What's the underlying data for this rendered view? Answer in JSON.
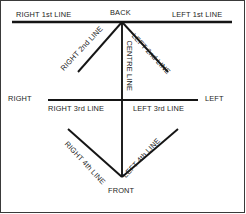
{
  "diagram": {
    "stroke_color": "#151515",
    "text_color": "#1c1c1c",
    "background_color": "#ffffff",
    "border_color": "#3a3a3a",
    "orientation_labels": {
      "back": "BACK",
      "front": "FRONT",
      "right": "RIGHT",
      "left": "LEFT"
    },
    "line_labels": {
      "right_1st": "RIGHT 1st LINE",
      "left_1st": "LEFT 1st LINE",
      "right_2nd": "RIGHT 2nd LINE",
      "left_2nd": "LEFT 2nd LINE",
      "centre": "CENTRE LINE",
      "right_3rd": "RIGHT 3rd LINE",
      "left_3rd": "LEFT 3rd LINE",
      "right_4th": "RIGHT 4th LINE",
      "left_4th": "LEFT 4th LINE"
    },
    "geometry": {
      "back_apex": [
        122,
        22
      ],
      "front_apex": [
        122,
        177
      ],
      "centre_intersection": [
        122,
        100
      ],
      "top_line": [
        12,
        22,
        232,
        22
      ],
      "middle_line": [
        48,
        100,
        198,
        100
      ],
      "right_2nd_end": [
        78,
        72
      ],
      "left_2nd_end": [
        168,
        72
      ],
      "right_4th_start": [
        68,
        129
      ],
      "left_4th_start": [
        178,
        129
      ]
    }
  }
}
